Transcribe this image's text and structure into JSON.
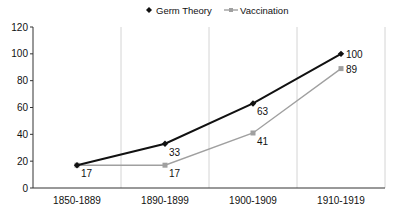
{
  "chart_data": {
    "type": "line",
    "title": "",
    "xlabel": "",
    "ylabel": "",
    "categories": [
      "1850-1889",
      "1890-1899",
      "1900-1909",
      "1910-1919"
    ],
    "series": [
      {
        "name": "Germ Theory",
        "values": [
          17,
          33,
          63,
          100
        ],
        "color": "#111111",
        "marker": "diamond"
      },
      {
        "name": "Vaccination",
        "values": [
          17,
          17,
          41,
          89
        ],
        "color": "#a0a0a0",
        "marker": "square"
      }
    ],
    "ylim": [
      0,
      120
    ],
    "yticks": [
      0,
      20,
      40,
      60,
      80,
      100,
      120
    ],
    "grid": {
      "vertical": true,
      "horizontal": false
    },
    "legend": {
      "position": "top"
    },
    "data_labels": true
  }
}
